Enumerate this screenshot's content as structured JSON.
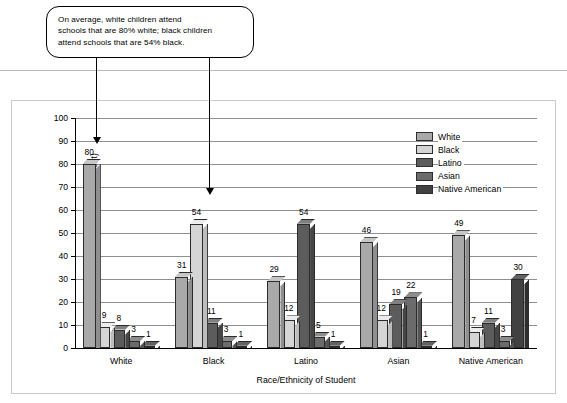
{
  "callout": {
    "lines": [
      "On average, white children attend",
      "schools that are 80% white; black children",
      "attend schools that are 54% black."
    ]
  },
  "chart_data": {
    "type": "bar",
    "title": "",
    "xlabel": "Race/Ethnicity of Student",
    "ylabel": "Racial/Ethnic Makeup of School (percent)",
    "ylim": [
      0,
      100
    ],
    "ytick_step": 10,
    "yticks": [
      "100",
      "90",
      "80",
      "70",
      "60",
      "50",
      "40",
      "30",
      "20",
      "10",
      "0"
    ],
    "grid": true,
    "legend_position": "top-right",
    "categories": [
      "White",
      "Black",
      "Latino",
      "Asian",
      "Native American"
    ],
    "series": [
      {
        "name": "White",
        "color": "#a9a9a9",
        "top": "#c6c6c6",
        "side": "#8f8f8f",
        "values": [
          80,
          31,
          29,
          46,
          49
        ]
      },
      {
        "name": "Black",
        "color": "#d5d5d5",
        "top": "#ececec",
        "side": "#bdbdbd",
        "values": [
          9,
          54,
          12,
          12,
          7
        ]
      },
      {
        "name": "Latino",
        "color": "#5c5c5c",
        "top": "#808080",
        "side": "#464646",
        "values": [
          8,
          11,
          54,
          19,
          11
        ]
      },
      {
        "name": "Asian",
        "color": "#6b6b6b",
        "top": "#8d8d8d",
        "side": "#545454",
        "values": [
          3,
          3,
          5,
          22,
          3
        ]
      },
      {
        "name": "Native American",
        "color": "#414141",
        "top": "#636363",
        "side": "#2e2e2e",
        "values": [
          1,
          1,
          1,
          1,
          30
        ]
      }
    ]
  },
  "legend": {
    "items": [
      {
        "label": "White"
      },
      {
        "label": "Black"
      },
      {
        "label": "Latino"
      },
      {
        "label": "Asian"
      },
      {
        "label": "Native American"
      }
    ]
  }
}
